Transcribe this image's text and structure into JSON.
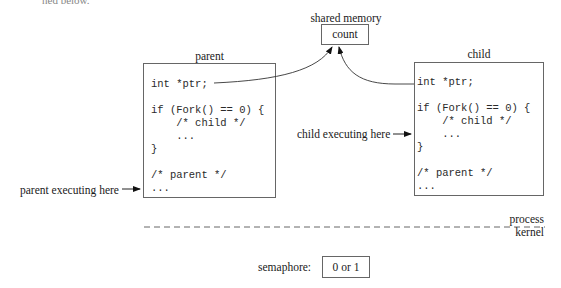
{
  "figure": {
    "cut_top_text": "ned below.",
    "shared_memory": {
      "label": "shared memory",
      "variable": "count"
    },
    "parent": {
      "title": "parent",
      "code_lines": [
        "int *ptr;",
        "",
        "if (Fork() == 0) {",
        "    /* child */",
        "    ...",
        "}",
        "",
        "/* parent */",
        "..."
      ],
      "executing_label": "parent executing here"
    },
    "child": {
      "title": "child",
      "code_lines": [
        "int *ptr;",
        "",
        "if (Fork() == 0) {",
        "    /* child */",
        "    ...",
        "}",
        "",
        "/* parent */",
        "..."
      ],
      "executing_label": "child executing here"
    },
    "boundary": {
      "upper_label": "process",
      "lower_label": "kernel"
    },
    "semaphore": {
      "label": "semaphore:",
      "value": "0 or 1"
    }
  }
}
